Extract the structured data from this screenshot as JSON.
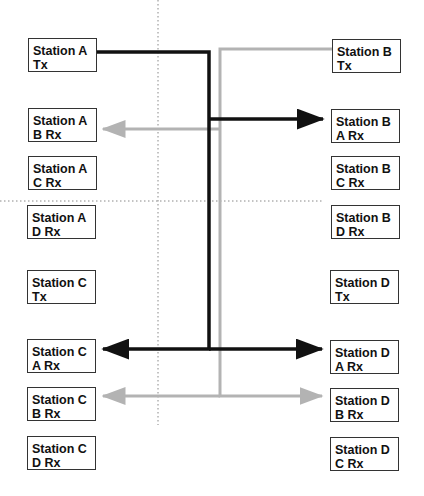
{
  "diagram": {
    "title": "",
    "colors": {
      "station_a_signal": "#111111",
      "station_b_signal": "#b3b3b3",
      "guide": "#888888"
    },
    "left_column": [
      {
        "id": "a-tx",
        "line1": "Station A",
        "line2": "Tx"
      },
      {
        "id": "a-brx",
        "line1": "Station A",
        "line2": "B Rx"
      },
      {
        "id": "a-crx",
        "line1": "Station A",
        "line2": "C Rx"
      },
      {
        "id": "a-drx",
        "line1": "Station A",
        "line2": "D Rx"
      },
      {
        "id": "c-tx",
        "line1": "Station C",
        "line2": "Tx"
      },
      {
        "id": "c-arx",
        "line1": "Station C",
        "line2": "A Rx"
      },
      {
        "id": "c-brx",
        "line1": "Station C",
        "line2": "B Rx"
      },
      {
        "id": "c-drx",
        "line1": "Station C",
        "line2": "D Rx"
      }
    ],
    "right_column": [
      {
        "id": "b-tx",
        "line1": "Station B",
        "line2": "Tx"
      },
      {
        "id": "b-arx",
        "line1": "Station B",
        "line2": "A Rx"
      },
      {
        "id": "b-crx",
        "line1": "Station B",
        "line2": "C Rx"
      },
      {
        "id": "b-drx",
        "line1": "Station B",
        "line2": "D Rx"
      },
      {
        "id": "d-tx",
        "line1": "Station D",
        "line2": "Tx"
      },
      {
        "id": "d-arx",
        "line1": "Station D",
        "line2": "A Rx"
      },
      {
        "id": "d-brx",
        "line1": "Station D",
        "line2": "B Rx"
      },
      {
        "id": "d-crx",
        "line1": "Station D",
        "line2": "C Rx"
      }
    ],
    "connections": [
      {
        "from": "Station A Tx",
        "to": [
          "Station B A Rx",
          "Station C A Rx",
          "Station D A Rx"
        ],
        "style": "black"
      },
      {
        "from": "Station B Tx",
        "to": [
          "Station A B Rx",
          "Station C B Rx",
          "Station D B Rx"
        ],
        "style": "gray"
      }
    ]
  }
}
